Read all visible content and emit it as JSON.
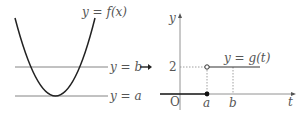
{
  "left_graph": {
    "curve_label": "y = f(x)",
    "line_b_label": "y = b",
    "line_a_label": "y = a"
  },
  "arrow": "→",
  "right_graph": {
    "y_axis_label": "y",
    "x_axis_label": "t",
    "origin_label": "O",
    "tick_y_label": "2",
    "tick_a_label": "a",
    "tick_b_label": "b",
    "curve_label": "y = g(t)"
  },
  "colors": {
    "curve": "#222222",
    "lines": "#777777",
    "text": "#555555"
  }
}
